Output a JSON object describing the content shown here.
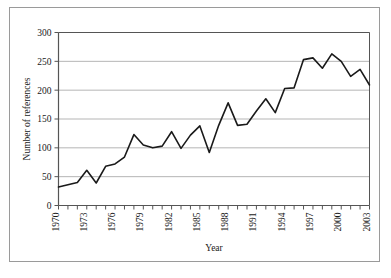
{
  "chart_data": {
    "type": "line",
    "title": "",
    "xlabel": "Year",
    "ylabel": "Number of references",
    "xlim": [
      1970,
      2003
    ],
    "ylim": [
      0,
      300
    ],
    "ytick_values": [
      0,
      50,
      100,
      150,
      200,
      250,
      300
    ],
    "ytick_labels": [
      "0",
      "50",
      "100",
      "150",
      "200",
      "250",
      "300"
    ],
    "xtick_labels": [
      "1970",
      "1973",
      "1976",
      "1979",
      "1982",
      "1985",
      "1988",
      "1991",
      "1994",
      "1997",
      "2000",
      "2003"
    ],
    "xtick_label_rotation": -90,
    "xtick_label_step": 3,
    "grid": "horizontal",
    "legend": "none",
    "line_color": "#1a1a1a",
    "grid_color": "#b5b5b5",
    "axis_color": "#555555",
    "x": [
      1970,
      1971,
      1972,
      1973,
      1974,
      1975,
      1976,
      1977,
      1978,
      1979,
      1980,
      1981,
      1982,
      1983,
      1984,
      1985,
      1986,
      1987,
      1988,
      1989,
      1990,
      1991,
      1992,
      1993,
      1994,
      1995,
      1996,
      1997,
      1998,
      1999,
      2000,
      2001,
      2002,
      2003
    ],
    "values": [
      32,
      36,
      40,
      61,
      39,
      68,
      72,
      84,
      123,
      105,
      100,
      103,
      128,
      99,
      122,
      138,
      92,
      139,
      178,
      139,
      141,
      164,
      185,
      161,
      203,
      204,
      253,
      256,
      238,
      263,
      250,
      224,
      236,
      209
    ],
    "series": [
      {
        "name": "Number of references",
        "values": [
          32,
          36,
          40,
          61,
          39,
          68,
          72,
          84,
          123,
          105,
          100,
          103,
          128,
          99,
          122,
          138,
          92,
          139,
          178,
          139,
          141,
          164,
          185,
          161,
          203,
          204,
          253,
          256,
          238,
          263,
          250,
          224,
          236,
          209
        ]
      }
    ]
  },
  "figure": {
    "xlabel": "Year",
    "ylabel": "Number of references"
  }
}
